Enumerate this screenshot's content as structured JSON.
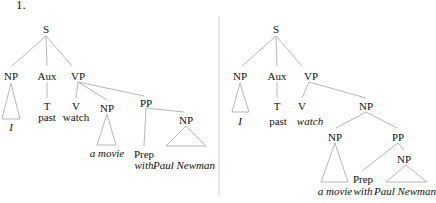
{
  "example_number": "1.",
  "edge_color": "#b8b8b8",
  "divider_color": "#d0d0d0",
  "trees": [
    {
      "id": "left",
      "nodes": [
        {
          "id": "S",
          "label": "S",
          "x": 46,
          "y": 23,
          "italic": false
        },
        {
          "id": "NP1",
          "label": "NP",
          "x": 11,
          "y": 70,
          "italic": false
        },
        {
          "id": "Aux",
          "label": "Aux",
          "x": 47,
          "y": 70,
          "italic": false
        },
        {
          "id": "VP",
          "label": "VP",
          "x": 78,
          "y": 70,
          "italic": false
        },
        {
          "id": "I",
          "label": "I",
          "x": 11,
          "y": 121,
          "italic": true
        },
        {
          "id": "T",
          "label": "T",
          "x": 47,
          "y": 100,
          "italic": false
        },
        {
          "id": "past",
          "label": "past",
          "x": 47,
          "y": 111,
          "italic": false
        },
        {
          "id": "V",
          "label": "V",
          "x": 76,
          "y": 100,
          "italic": false
        },
        {
          "id": "watch",
          "label": "watch",
          "x": 76,
          "y": 111,
          "italic": false
        },
        {
          "id": "NP2",
          "label": "NP",
          "x": 107,
          "y": 102,
          "italic": false
        },
        {
          "id": "amovie",
          "label": "a movie",
          "x": 107,
          "y": 147,
          "italic": true
        },
        {
          "id": "PP",
          "label": "PP",
          "x": 146,
          "y": 97,
          "italic": false
        },
        {
          "id": "Prep",
          "label": "Prep",
          "x": 144,
          "y": 148,
          "italic": false
        },
        {
          "id": "with",
          "label": "with",
          "x": 144,
          "y": 159,
          "italic": true
        },
        {
          "id": "NP3",
          "label": "NP",
          "x": 186,
          "y": 114,
          "italic": false
        },
        {
          "id": "paul",
          "label": "Paul Newman",
          "x": 184,
          "y": 159,
          "italic": true
        }
      ],
      "edges": [
        [
          46,
          36,
          12,
          66
        ],
        [
          46,
          36,
          47,
          66
        ],
        [
          46,
          36,
          72,
          66
        ],
        [
          78,
          82,
          76,
          98
        ],
        [
          78,
          82,
          107,
          100
        ],
        [
          78,
          82,
          144,
          96
        ],
        [
          47,
          82,
          47,
          98
        ],
        [
          146,
          108,
          144,
          146
        ],
        [
          146,
          108,
          184,
          112
        ]
      ],
      "triangles": [
        {
          "apex": [
            11,
            83
          ],
          "left": 2,
          "right": 20,
          "base": 119
        },
        {
          "apex": [
            107,
            114
          ],
          "left": 97,
          "right": 116,
          "base": 145
        },
        {
          "apex": [
            186,
            126
          ],
          "left": 166,
          "right": 206,
          "base": 146
        }
      ]
    },
    {
      "id": "right",
      "nodes": [
        {
          "id": "S",
          "label": "S",
          "x": 276,
          "y": 23,
          "italic": false
        },
        {
          "id": "NP1",
          "label": "NP",
          "x": 240,
          "y": 70,
          "italic": false
        },
        {
          "id": "Aux",
          "label": "Aux",
          "x": 277,
          "y": 70,
          "italic": false
        },
        {
          "id": "VP",
          "label": "VP",
          "x": 311,
          "y": 70,
          "italic": false
        },
        {
          "id": "I",
          "label": "I",
          "x": 240,
          "y": 115,
          "italic": true
        },
        {
          "id": "T",
          "label": "T",
          "x": 277,
          "y": 100,
          "italic": false
        },
        {
          "id": "past",
          "label": "past",
          "x": 278,
          "y": 115,
          "italic": false
        },
        {
          "id": "V",
          "label": "V",
          "x": 302,
          "y": 100,
          "italic": false
        },
        {
          "id": "watch",
          "label": "watch",
          "x": 310,
          "y": 115,
          "italic": true
        },
        {
          "id": "NP2",
          "label": "NP",
          "x": 366,
          "y": 100,
          "italic": false
        },
        {
          "id": "NP3",
          "label": "NP",
          "x": 335,
          "y": 131,
          "italic": false
        },
        {
          "id": "PP",
          "label": "PP",
          "x": 398,
          "y": 131,
          "italic": false
        },
        {
          "id": "NP4",
          "label": "NP",
          "x": 404,
          "y": 153,
          "italic": false
        },
        {
          "id": "Prep",
          "label": "Prep",
          "x": 363,
          "y": 173,
          "italic": false
        },
        {
          "id": "amovie",
          "label": "a movie",
          "x": 335,
          "y": 185,
          "italic": true
        },
        {
          "id": "with",
          "label": "with",
          "x": 363,
          "y": 185,
          "italic": true
        },
        {
          "id": "paul",
          "label": "Paul Newman",
          "x": 405,
          "y": 185,
          "italic": true
        }
      ],
      "edges": [
        [
          276,
          36,
          242,
          66
        ],
        [
          276,
          36,
          277,
          66
        ],
        [
          276,
          36,
          302,
          66
        ],
        [
          277,
          82,
          277,
          98
        ],
        [
          309,
          82,
          302,
          98
        ],
        [
          309,
          82,
          366,
          98
        ],
        [
          366,
          112,
          336,
          128
        ],
        [
          366,
          112,
          397,
          128
        ],
        [
          398,
          143,
          404,
          150
        ],
        [
          398,
          143,
          362,
          171
        ]
      ],
      "triangles": [
        {
          "apex": [
            240,
            83
          ],
          "left": 232,
          "right": 249,
          "base": 112
        },
        {
          "apex": [
            335,
            143
          ],
          "left": 321,
          "right": 348,
          "base": 182
        },
        {
          "apex": [
            406,
            165
          ],
          "left": 386,
          "right": 427,
          "base": 182
        }
      ]
    }
  ],
  "divider": {
    "x": 219,
    "y1": 16,
    "y2": 196
  }
}
